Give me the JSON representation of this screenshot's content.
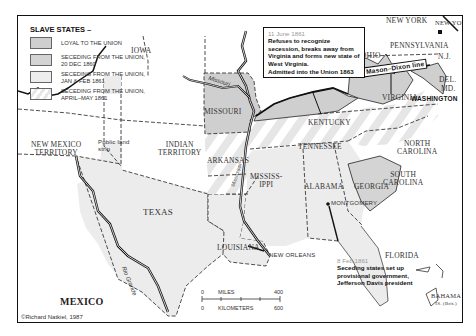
{
  "legend": {
    "title": "SLAVE STATES –",
    "items": [
      {
        "label_1": "LOYAL TO THE UNION",
        "label_2": "",
        "color": "#cfcfcf"
      },
      {
        "label_1": "SECEDING FROM THE UNION,",
        "label_2": "20 DEC 1860",
        "color": "#d9d9d9"
      },
      {
        "label_1": "SECEDING FROM THE UNION,",
        "label_2": "JAN & FEB 1861",
        "color": "#ececec"
      },
      {
        "label_1": "SECEDING FROM THE UNION,",
        "label_2": "APRIL–MAY 1861",
        "color": "striped"
      }
    ]
  },
  "regions": {
    "iowa": "IOWA",
    "missouri": "MISSOURI",
    "ohio": "OHIO",
    "new_york_state": "NEW YORK",
    "new_york_city": "NEW YORK",
    "pennsylvania": "PENNSYLVANIA",
    "nj": "N.J.",
    "del": "DEL.",
    "md": "MD.",
    "virginia": "VIRGINIA",
    "washington": "WASHINGTON",
    "kentucky": "KENTUCKY",
    "tennessee": "TENNESSEE",
    "north_carolina_1": "NORTH",
    "north_carolina_2": "CAROLINA",
    "south_carolina_1": "SOUTH",
    "south_carolina_2": "CAROLINA",
    "new_mexico_1": "NEW MEXICO",
    "new_mexico_2": "TERRITORY",
    "indian_1": "INDIAN",
    "indian_2": "TERRITORY",
    "public_land_1": "Public land",
    "public_land_2": "strip",
    "arkansas": "ARKANSAS",
    "mississippi_1": "MISSISS-",
    "mississippi_2": "IPPI",
    "alabama": "ALABAMA",
    "georgia": "GEORGIA",
    "montgomery": "MONTGOMERY",
    "texas": "TEXAS",
    "louisiana": "LOUISIANA",
    "new_orleans": "NEW ORLEANS",
    "florida": "FLORIDA",
    "mexico": "MEXICO",
    "bahama_1": "BAHAMA",
    "bahama_2": "IS. (Brit.)"
  },
  "rivers": {
    "missouri": "Missouri",
    "mississippi": "Mississippi",
    "ohio": "Ohio",
    "rio_grande": "Rio Grande"
  },
  "mason_dixon": "Mason–Dixon line",
  "notes": {
    "west_virginia": {
      "date": "11 June 1861",
      "text": "Refuses to recognize secession, breaks away from Virginia and forms new state of West Virginia.",
      "text2": "Admitted into the Union 1863"
    },
    "confederacy": {
      "date": "8 Feb 1861",
      "text": "Seceding states set up provisional government, Jefferson Davis president"
    }
  },
  "scale": {
    "miles_label": "MILES",
    "km_label": "KILOMETERS",
    "miles_zero": "0",
    "miles_max": "400",
    "km_zero": "0",
    "km_max": "600"
  },
  "credit": "©Richard Natkiel, 1987",
  "colors": {
    "loyal": "#cfcfcf",
    "dec1860": "#d4d4d4",
    "janfeb1861": "#ebebeb",
    "aprmay1861_stripe": "#e4e4e4",
    "border": "#111111"
  }
}
